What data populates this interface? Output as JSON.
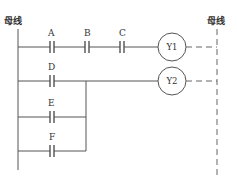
{
  "diagram": {
    "type": "ladder-logic",
    "left_bus_label": "母线",
    "right_bus_label": "母线",
    "rungs": [
      {
        "contacts": [
          "A",
          "B",
          "C"
        ],
        "arrangement": "series",
        "coil": "Y1"
      },
      {
        "contacts": [
          "D",
          "E",
          "F"
        ],
        "arrangement": "parallel",
        "coil": "Y2"
      }
    ]
  }
}
